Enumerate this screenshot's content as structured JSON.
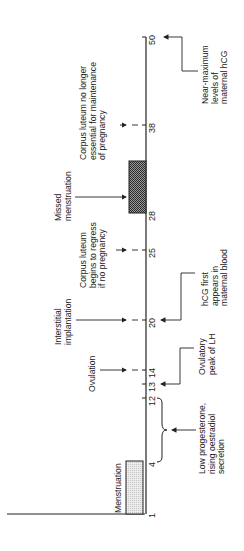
{
  "diagram": {
    "title": "",
    "orientation": "rotated-90-ccw",
    "axis": {
      "ticks": [
        {
          "label": "1",
          "day": 1,
          "y": 514
        },
        {
          "label": "4",
          "day": 4,
          "y": 462
        },
        {
          "label": "12",
          "day": 12,
          "y": 398
        },
        {
          "label": "13",
          "day": 13,
          "y": 384
        },
        {
          "label": "14",
          "day": 14,
          "y": 370
        },
        {
          "label": "20",
          "day": 20,
          "y": 320
        },
        {
          "label": "25",
          "day": 25,
          "y": 250
        },
        {
          "label": "28",
          "day": 28,
          "y": 213
        },
        {
          "label": "38",
          "day": 38,
          "y": 125
        },
        {
          "label": "50",
          "day": 50,
          "y": 37
        }
      ]
    },
    "bars": {
      "menstruation": {
        "label": "Menstruation",
        "from_day": 1,
        "to_day": 4,
        "color": "#d8d8d8"
      },
      "missed_menstruation": {
        "label": "Missed\nmenstruation",
        "from_day": 28,
        "to_day": 32,
        "color": "#6a6a6a"
      }
    },
    "left_annotations": [
      {
        "id": "ovulation",
        "text": "Ovulation",
        "day": 14
      },
      {
        "id": "implantation",
        "text": "Interstitial\nimplantation",
        "day": 20
      },
      {
        "id": "cl_regress",
        "text": "Corpus luteum\nbegins to regress\nif no pregnancy",
        "day": 25
      },
      {
        "id": "missed",
        "text": "Missed\nmenstruation",
        "day": 28
      },
      {
        "id": "cl_not_essential",
        "text": "Corpus luteum no longer\nessential for maintenance\nof pregnancy",
        "day": 38
      }
    ],
    "right_annotations": [
      {
        "id": "low_prog",
        "text": "Low progesterone,\nrising oestradiol\nsecretion",
        "range": "4-12"
      },
      {
        "id": "lh_peak",
        "text": "Ovulatory\npeak of LH",
        "day": 13
      },
      {
        "id": "hcg_first",
        "text": "hCG first\nappears in\nmaternal blood",
        "day": 20
      },
      {
        "id": "hcg_max",
        "text": "Near-maximum\nlevels of\nmaternal hCG",
        "day": 50
      }
    ]
  }
}
